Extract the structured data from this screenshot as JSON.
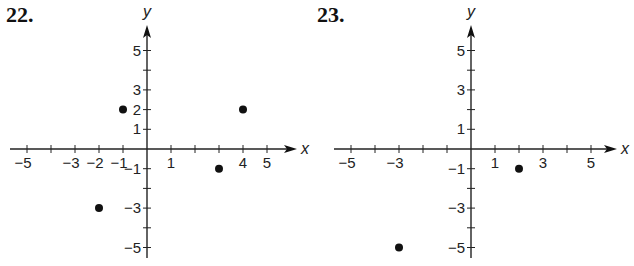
{
  "chart_data": [
    {
      "type": "scatter",
      "title": "22.",
      "xlabel": "x",
      "ylabel": "y",
      "xlim": [
        -6,
        6
      ],
      "ylim": [
        -5.5,
        6
      ],
      "grid": false,
      "x_tick_labels": [
        "-5",
        "-3",
        "-2",
        "-1",
        "1",
        "4",
        "5"
      ],
      "y_tick_labels": [
        "5",
        "3",
        "2",
        "1",
        "-1",
        "-3",
        "-5"
      ],
      "points": [
        {
          "x": -1,
          "y": 2
        },
        {
          "x": 4,
          "y": 2
        },
        {
          "x": 3,
          "y": -1
        },
        {
          "x": -2,
          "y": -3
        }
      ]
    },
    {
      "type": "scatter",
      "title": "23.",
      "xlabel": "x",
      "ylabel": "y",
      "xlim": [
        -6,
        6
      ],
      "ylim": [
        -5.5,
        6
      ],
      "grid": false,
      "x_tick_labels": [
        "-5",
        "-3",
        "1",
        "3",
        "5"
      ],
      "y_tick_labels": [
        "5",
        "3",
        "1",
        "-1",
        "-3",
        "-5"
      ],
      "points": [
        {
          "x": 2,
          "y": -1
        },
        {
          "x": -3,
          "y": -5
        }
      ]
    }
  ],
  "panels": [
    {
      "label": "22."
    },
    {
      "label": "23."
    }
  ]
}
